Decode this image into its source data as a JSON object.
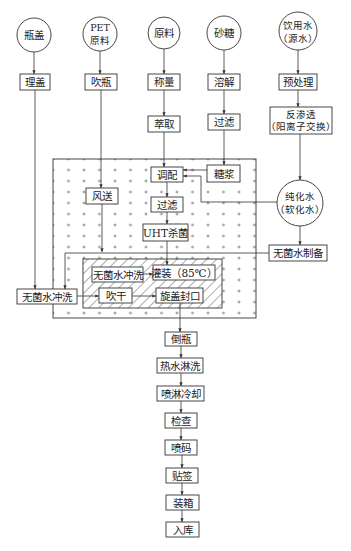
{
  "diagram": {
    "title": "",
    "sources": {
      "bottle_cap": "瓶盖",
      "pet_line1": "PET",
      "pet_line2": "原料",
      "raw_material": "原料",
      "sugar": "砂糖",
      "water_line1": "饮用水",
      "water_line2": "（源水）"
    },
    "steps": {
      "sort_caps": "理盖",
      "blow_bottles": "吹瓶",
      "weigh": "称量",
      "dissolve": "溶解",
      "pretreat": "预处理",
      "extract": "萃取",
      "sugar_filter": "过滤",
      "ro_line1": "反渗透",
      "ro_line2": "（阳离子交换）",
      "blend": "调配",
      "syrup": "糖浆",
      "air_convey": "风送",
      "filter": "过滤",
      "uht": "UHT杀菌",
      "pure_water_line1": "纯化水",
      "pure_water_line2": "（软化水）",
      "sterile_water_prep": "无菌水制备",
      "cap_rinse": "无菌水冲洗",
      "bottle_rinse": "无菌水冲洗",
      "fill": "灌装（85℃）",
      "blow_dry": "吹干",
      "cap_seal": "旋盖封口",
      "invert": "倒瓶",
      "hot_rinse": "热水淋洗",
      "spray_cool": "喷淋冷却",
      "inspect": "检查",
      "code_print": "喷码",
      "labeling": "贴签",
      "boxing": "装箱",
      "warehouse": "入库"
    },
    "zones": {
      "clean_zone_pattern": "plus-dots",
      "aseptic_zone_pattern": "diagonal-hatch"
    },
    "colors": {
      "line": "#333333",
      "text": "#222222",
      "background": "#ffffff"
    }
  }
}
